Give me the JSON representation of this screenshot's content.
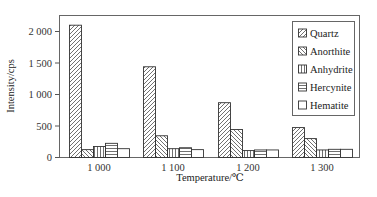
{
  "chart_data": {
    "type": "bar",
    "title": "",
    "xlabel": "Temperature/℃",
    "ylabel": "Intensity/cps",
    "categories": [
      "1 000",
      "1 100",
      "1 200",
      "1 300"
    ],
    "ylim": [
      0,
      2250
    ],
    "yticks": [
      0,
      500,
      1000,
      1500,
      2000
    ],
    "ytick_labels": [
      "0",
      "500",
      "1 000",
      "1 500",
      "2 000"
    ],
    "grid": false,
    "legend_position": "upper right",
    "series": [
      {
        "name": "Quartz",
        "pattern": "diag-right",
        "values": [
          2100,
          1440,
          870,
          475
        ]
      },
      {
        "name": "Anorthite",
        "pattern": "diag-left",
        "values": [
          125,
          345,
          445,
          300
        ]
      },
      {
        "name": "Anhydrite",
        "pattern": "vertical",
        "values": [
          175,
          140,
          110,
          120
        ]
      },
      {
        "name": "Hercynite",
        "pattern": "horizontal",
        "values": [
          225,
          155,
          120,
          130
        ]
      },
      {
        "name": "Hematite",
        "pattern": "none",
        "values": [
          140,
          125,
          120,
          130
        ]
      }
    ]
  },
  "colors": {
    "line": "#333333",
    "background": "#ffffff",
    "frame": "#555555"
  }
}
